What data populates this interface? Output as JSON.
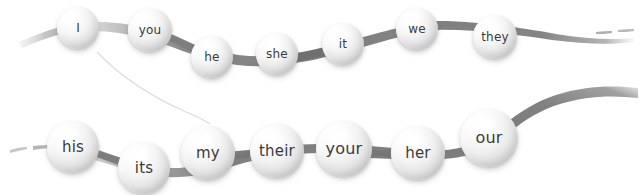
{
  "canvas": {
    "width": 640,
    "height": 195,
    "background": "#ffffff",
    "title": "Pronoun chain diagram"
  },
  "style": {
    "ribbon_color": "#8a8a8a",
    "ribbon_color_light": "#a5a5a5",
    "sphere_highlight": "#ffffff",
    "sphere_shadow": "#bcbcbc",
    "label_color": "#3b3b3b",
    "thin_line_color": "#d8d8d8"
  },
  "rows": [
    {
      "name": "subject-pronouns",
      "nodes": [
        {
          "label": "I",
          "cx": 78,
          "cy": 28,
          "r": 21
        },
        {
          "label": "you",
          "cx": 150,
          "cy": 30,
          "r": 22
        },
        {
          "label": "he",
          "cx": 212,
          "cy": 57,
          "r": 21
        },
        {
          "label": "she",
          "cx": 277,
          "cy": 54,
          "r": 21
        },
        {
          "label": "it",
          "cx": 343,
          "cy": 44,
          "r": 21
        },
        {
          "label": "we",
          "cx": 417,
          "cy": 29,
          "r": 21
        },
        {
          "label": "they",
          "cx": 495,
          "cy": 37,
          "r": 22
        }
      ]
    },
    {
      "name": "possessive-pronouns",
      "nodes": [
        {
          "label": "his",
          "cx": 73,
          "cy": 147,
          "r": 26
        },
        {
          "label": "its",
          "cx": 144,
          "cy": 168,
          "r": 26
        },
        {
          "label": "my",
          "cx": 208,
          "cy": 153,
          "r": 27
        },
        {
          "label": "their",
          "cx": 277,
          "cy": 151,
          "r": 27
        },
        {
          "label": "your",
          "cx": 344,
          "cy": 149,
          "r": 28
        },
        {
          "label": "her",
          "cx": 418,
          "cy": 153,
          "r": 27
        },
        {
          "label": "our",
          "cx": 489,
          "cy": 138,
          "r": 29
        }
      ]
    }
  ]
}
